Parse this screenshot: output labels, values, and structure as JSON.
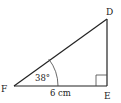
{
  "diagram": {
    "type": "right-triangle",
    "vertices": {
      "D": {
        "label": "D",
        "x": 107,
        "y": 19
      },
      "E": {
        "label": "E",
        "x": 107,
        "y": 86
      },
      "F": {
        "label": "F",
        "x": 14,
        "y": 86
      }
    },
    "right_angle_at": "E",
    "angle": {
      "vertex": "F",
      "label": "38°"
    },
    "side": {
      "between": [
        "F",
        "E"
      ],
      "label": "6 cm"
    },
    "colors": {
      "stroke": "#222222",
      "background": "#ffffff"
    }
  }
}
